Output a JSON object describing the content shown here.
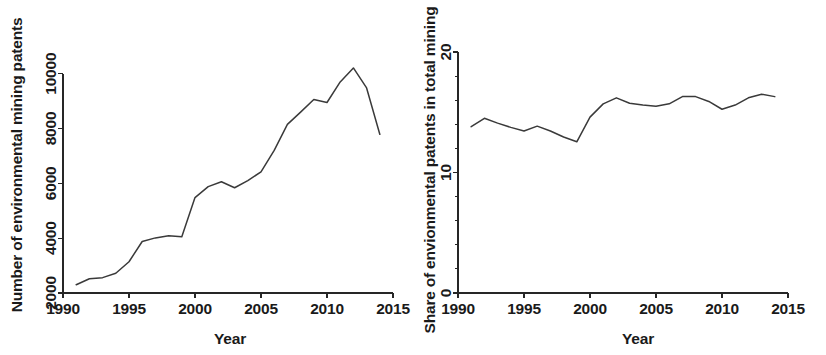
{
  "figure": {
    "background": "#ffffff",
    "line_color": "#3a3a3a",
    "axis_color": "#262626",
    "panels": [
      "left",
      "right"
    ]
  },
  "chart_data": [
    {
      "type": "line",
      "panel": "left",
      "title": "",
      "xlabel": "Year",
      "ylabel": "Number of environmental mining patents",
      "xlim": [
        1990,
        2015
      ],
      "ylim": [
        2000,
        10500
      ],
      "xticks": [
        1990,
        1995,
        2000,
        2005,
        2010,
        2015
      ],
      "xticklabels": [
        "1990",
        "1995",
        "2000",
        "2005",
        "2010",
        "2015"
      ],
      "yticks": [
        2000,
        4000,
        6000,
        8000,
        10000
      ],
      "yticklabels": [
        "2000",
        "4000",
        "6000",
        "8000",
        "10000"
      ],
      "grid": false,
      "legend": null,
      "x": [
        1991,
        1992,
        1993,
        1994,
        1995,
        1996,
        1997,
        1998,
        1999,
        2000,
        2001,
        2002,
        2003,
        2004,
        2005,
        2006,
        2007,
        2008,
        2009,
        2010,
        2011,
        2012,
        2013,
        2014
      ],
      "values": [
        2300,
        2520,
        2560,
        2720,
        3140,
        3880,
        4010,
        4090,
        4050,
        5480,
        5880,
        6060,
        5840,
        6100,
        6420,
        7200,
        8150,
        8600,
        9060,
        8950,
        9700,
        10210,
        9480,
        7790
      ]
    },
    {
      "type": "line",
      "panel": "right",
      "title": "",
      "xlabel": "Year",
      "ylabel": "Share of envionmental patents in total mining",
      "xlim": [
        1990,
        2015
      ],
      "ylim": [
        0,
        21
      ],
      "xticks": [
        1990,
        1995,
        2000,
        2005,
        2010,
        2015
      ],
      "xticklabels": [
        "1990",
        "1995",
        "2000",
        "2005",
        "2010",
        "2015"
      ],
      "yticks": [
        0,
        10,
        20
      ],
      "yticklabels": [
        "0",
        "10",
        "20"
      ],
      "yminorticks": [
        2,
        4,
        6,
        8,
        12,
        14,
        16,
        18
      ],
      "grid": false,
      "legend": null,
      "x": [
        1991,
        1992,
        1993,
        1994,
        1995,
        1996,
        1997,
        1998,
        1999,
        2000,
        2001,
        2002,
        2003,
        2004,
        2005,
        2006,
        2007,
        2008,
        2009,
        2010,
        2011,
        2012,
        2013,
        2014
      ],
      "values": [
        13.8,
        14.5,
        14.1,
        13.75,
        13.45,
        13.85,
        13.45,
        12.95,
        12.55,
        14.6,
        15.7,
        16.2,
        15.75,
        15.6,
        15.5,
        15.7,
        16.3,
        16.3,
        15.9,
        15.25,
        15.6,
        16.2,
        16.5,
        16.3
      ]
    }
  ]
}
